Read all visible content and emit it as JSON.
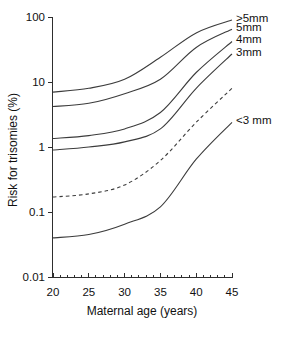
{
  "chart_data": {
    "type": "line",
    "title": "",
    "xlabel": "Maternal age (years)",
    "ylabel": "Risk for trisomies (%)",
    "x_scale": "linear",
    "y_scale": "log",
    "xlim": [
      20,
      45
    ],
    "ylim": [
      0.01,
      100
    ],
    "grid": false,
    "legend_position": "right-edge-labels",
    "line_color": "#3c3c3c",
    "text_color": "#111111",
    "x_ticks": [
      {
        "label": "20",
        "value": 20
      },
      {
        "label": "25",
        "value": 25
      },
      {
        "label": "30",
        "value": 30
      },
      {
        "label": "35",
        "value": 35
      },
      {
        "label": "40",
        "value": 40
      },
      {
        "label": "45",
        "value": 45
      }
    ],
    "x_minor_tick_step": 1,
    "y_ticks": [
      {
        "label": "100",
        "value": 100
      },
      {
        "label": "10",
        "value": 10
      },
      {
        "label": "1",
        "value": 1
      },
      {
        "label": "0.1",
        "value": 0.1
      },
      {
        "label": "0.01",
        "value": 0.01
      }
    ],
    "x": [
      20,
      25,
      30,
      35,
      40,
      45
    ],
    "series": [
      {
        "label": ">5mm",
        "line_style": "solid",
        "values": [
          7,
          8,
          11,
          24,
          57,
          90
        ]
      },
      {
        "label": "5mm",
        "line_style": "solid",
        "values": [
          4.2,
          4.7,
          6.6,
          11,
          34,
          65
        ]
      },
      {
        "label": "4mm",
        "line_style": "solid",
        "values": [
          1.35,
          1.5,
          1.9,
          3.4,
          14,
          42
        ]
      },
      {
        "label": "3mm",
        "line_style": "solid",
        "values": [
          0.9,
          1.0,
          1.2,
          1.9,
          8,
          27
        ]
      },
      {
        "label": "",
        "line_style": "dashed",
        "values": [
          0.17,
          0.19,
          0.26,
          0.62,
          2.4,
          8
        ]
      },
      {
        "label": "<3 mm",
        "line_style": "solid",
        "values": [
          0.04,
          0.045,
          0.065,
          0.12,
          0.65,
          2.4
        ]
      }
    ]
  }
}
